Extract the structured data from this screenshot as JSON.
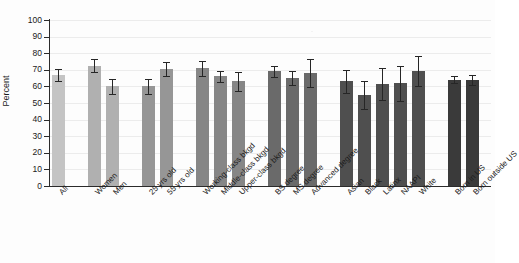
{
  "chart_data": {
    "type": "bar",
    "title": "",
    "subtitle": "",
    "xlabel": "",
    "ylabel": "Percent",
    "ylim": [
      0,
      100
    ],
    "ytick_values": [
      0,
      10,
      20,
      30,
      40,
      50,
      60,
      70,
      80,
      90,
      100
    ],
    "ytick_labels": [
      "0",
      "10",
      "20",
      "30",
      "40",
      "50",
      "60",
      "70",
      "80",
      "90",
      "100"
    ],
    "grid": true,
    "legend": "none",
    "orientation": "vertical",
    "error_bars": "95% CI",
    "categories": [
      "All",
      "Women",
      "Men",
      "25 yrs old",
      "55 yrs old",
      "Working-class bkgd",
      "Middle-class bkgd",
      "Upper-class bkgd",
      "BS degree",
      "MS degree",
      "Advanced degree",
      "Asian",
      "Black",
      "Latinx",
      "NAAPI",
      "White",
      "Born in US",
      "Born outside US"
    ],
    "values": [
      67,
      72.5,
      60,
      60,
      70.5,
      71,
      66,
      63,
      69,
      65,
      68,
      63,
      55,
      61.5,
      62,
      69.5,
      64,
      64
    ],
    "err_low": [
      63.5,
      68.5,
      55.5,
      55.5,
      66.5,
      66.5,
      62.5,
      57.5,
      65.5,
      61,
      59.5,
      56,
      46.5,
      52,
      51.5,
      60.5,
      62,
      61
    ],
    "err_high": [
      70.5,
      76.5,
      64.5,
      64.5,
      74.5,
      75.5,
      69.5,
      68.5,
      72.5,
      69,
      76.5,
      70,
      63.5,
      71,
      72.5,
      78.5,
      66.5,
      67
    ],
    "series": [
      {
        "name": "Percent",
        "values": [
          67,
          72.5,
          60,
          60,
          70.5,
          71,
          66,
          63,
          69,
          65,
          68,
          63,
          55,
          61.5,
          62,
          69.5,
          64,
          64
        ]
      }
    ],
    "groups": [
      {
        "name": "Overall",
        "indices": [
          0
        ],
        "color": "#c4c4c4"
      },
      {
        "name": "Gender",
        "indices": [
          1,
          2
        ],
        "color": "#b0b0b0"
      },
      {
        "name": "Age",
        "indices": [
          3,
          4
        ],
        "color": "#969696"
      },
      {
        "name": "Class background",
        "indices": [
          5,
          6,
          7
        ],
        "color": "#868686"
      },
      {
        "name": "Education",
        "indices": [
          8,
          9,
          10
        ],
        "color": "#6a6a6a"
      },
      {
        "name": "Race/ethnicity",
        "indices": [
          11,
          12,
          13,
          14,
          15
        ],
        "color": "#4f4f4f"
      },
      {
        "name": "Nativity",
        "indices": [
          16,
          17
        ],
        "color": "#3a3a3a"
      }
    ],
    "bar_colors": [
      "#c4c4c4",
      "#b0b0b0",
      "#b0b0b0",
      "#969696",
      "#969696",
      "#868686",
      "#868686",
      "#868686",
      "#6a6a6a",
      "#6a6a6a",
      "#6a6a6a",
      "#4f4f4f",
      "#4f4f4f",
      "#4f4f4f",
      "#4f4f4f",
      "#4f4f4f",
      "#3a3a3a",
      "#3a3a3a"
    ],
    "bar_left_px": [
      52,
      88,
      106,
      142,
      160,
      196,
      214,
      232,
      268,
      286,
      304,
      340,
      358,
      376,
      394,
      412,
      448,
      466
    ],
    "error_bar_color": "#262626",
    "axis_color": "#2b2b2b",
    "grid_color": "#ececec",
    "background": "#fdfdfd"
  }
}
